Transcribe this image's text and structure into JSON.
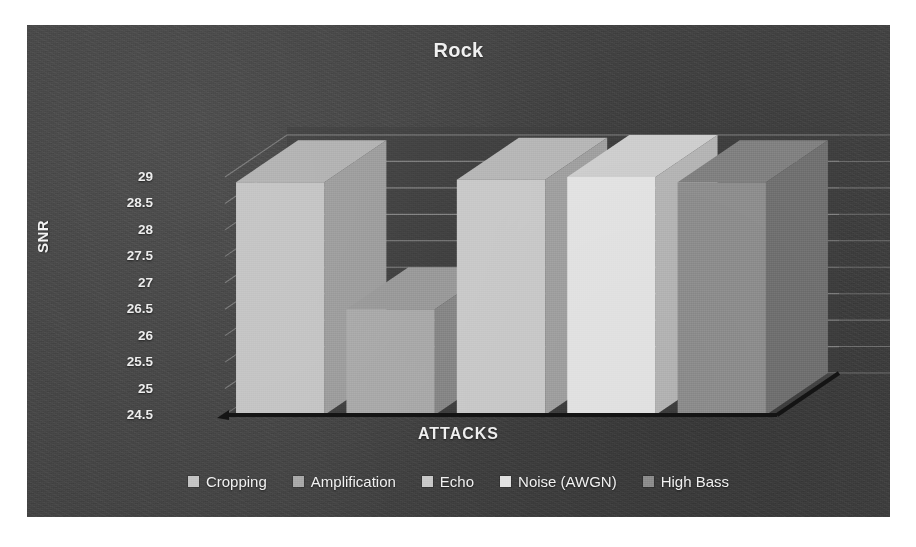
{
  "panel": {
    "background_color": "#434343",
    "page_background_color": "#ffffff"
  },
  "chart_data": {
    "type": "bar",
    "title": "Rock",
    "xlabel": "ATTACKS",
    "ylabel": "SNR",
    "categories": [
      "Cropping",
      "Amplification",
      "Echo",
      "Noise (AWGN)",
      "High Bass"
    ],
    "values": [
      28.9,
      26.5,
      28.95,
      29.0,
      28.9
    ],
    "series": [
      {
        "name": "Cropping",
        "value": 28.9,
        "color": "#c4c4c4"
      },
      {
        "name": "Amplification",
        "value": 26.5,
        "color": "#a9a9a9"
      },
      {
        "name": "Echo",
        "value": 28.95,
        "color": "#c9c9c9"
      },
      {
        "name": "Noise (AWGN)",
        "value": 29.0,
        "color": "#e2e2e2"
      },
      {
        "name": "High Bass",
        "value": 28.9,
        "color": "#8f8f8f"
      }
    ],
    "ylim": [
      24.5,
      29.0
    ],
    "ytick_labels": [
      "29",
      "28.5",
      "28",
      "27.5",
      "27",
      "26.5",
      "26",
      "25.5",
      "25",
      "24.5"
    ],
    "ytick_values": [
      29,
      28.5,
      28,
      27.5,
      27,
      26.5,
      26,
      25.5,
      25,
      24.5
    ],
    "grid": true,
    "legend_position": "bottom",
    "three_d": true,
    "style": "grayscale-scanned"
  },
  "legend": {
    "items": [
      {
        "label": "Cropping",
        "color": "#c4c4c4"
      },
      {
        "label": "Amplification",
        "color": "#a9a9a9"
      },
      {
        "label": "Echo",
        "color": "#c9c9c9"
      },
      {
        "label": "Noise (AWGN)",
        "color": "#e2e2e2"
      },
      {
        "label": "High Bass",
        "color": "#8f8f8f"
      }
    ]
  }
}
